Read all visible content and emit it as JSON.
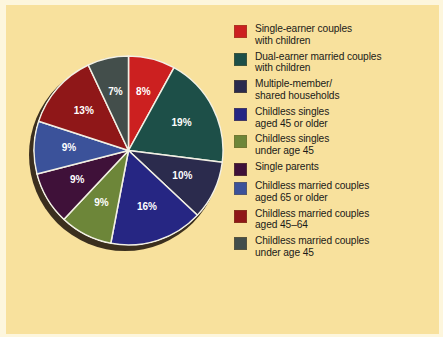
{
  "colors": {
    "page_background": "#fdf6dd",
    "panel_background": "#f8e19d",
    "slice_border": "#f2f0e4",
    "label_text": "#ffffff",
    "legend_text": "#1a1a18",
    "shadow": "#2a1f14"
  },
  "chart_data": {
    "type": "pie",
    "title": "",
    "legend_position": "right",
    "total": 100,
    "categories": [
      "Single-earner couples with children",
      "Dual-earner married couples with children",
      "Multiple-member/ shared households",
      "Childless singles aged 45 or older",
      "Childless singles under age 45",
      "Single parents",
      "Childless married couples aged 65 or older",
      "Childless married couples aged 45–64",
      "Childless married couples under age 45"
    ],
    "values": [
      8,
      19,
      10,
      16,
      9,
      9,
      9,
      13,
      7
    ],
    "value_labels": [
      "8%",
      "19%",
      "10%",
      "16%",
      "9%",
      "9%",
      "9%",
      "13%",
      "7%"
    ],
    "colors": [
      "#cc2020",
      "#1d4f48",
      "#2b2b4d",
      "#262683",
      "#6d8639",
      "#3f1139",
      "#3b529a",
      "#8f1718",
      "#434e4b"
    ],
    "start_angle_deg": 0,
    "direction": "clockwise"
  },
  "legend": {
    "items": [
      {
        "label": "Single-earner couples\nwith children",
        "color": "#cc2020",
        "value_label": "8%"
      },
      {
        "label": "Dual-earner married couples\nwith children",
        "color": "#1d4f48",
        "value_label": "19%"
      },
      {
        "label": "Multiple-member/\nshared households",
        "color": "#2b2b4d",
        "value_label": "10%"
      },
      {
        "label": "Childless singles\naged 45 or older",
        "color": "#262683",
        "value_label": "16%"
      },
      {
        "label": "Childless singles\nunder age 45",
        "color": "#6d8639",
        "value_label": "9%"
      },
      {
        "label": "Single parents",
        "color": "#3f1139",
        "value_label": "9%"
      },
      {
        "label": "Childless married couples\naged 65 or older",
        "color": "#3b529a",
        "value_label": "9%"
      },
      {
        "label": "Childless married couples\naged 45–64",
        "color": "#8f1718",
        "value_label": "13%"
      },
      {
        "label": "Childless married couples\nunder age 45",
        "color": "#434e4b",
        "value_label": "7%"
      }
    ]
  }
}
